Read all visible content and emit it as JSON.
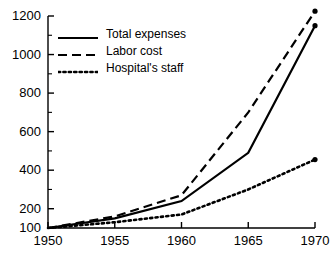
{
  "chart_data": {
    "type": "line",
    "title": "",
    "subtitle": "",
    "xlabel": "",
    "ylabel": "",
    "x": [
      1950,
      1955,
      1960,
      1965,
      1970
    ],
    "xlim": [
      1950,
      1970
    ],
    "ylim": [
      100,
      1200
    ],
    "grid": false,
    "legend_position": "top-left",
    "x_tick_labels": [
      "1950",
      "1955",
      "1960",
      "1965",
      "1970"
    ],
    "y_tick_labels": [
      "100",
      "200",
      "400",
      "600",
      "800",
      "1000",
      "1200"
    ],
    "y_tick_values": [
      100,
      200,
      400,
      600,
      800,
      1000,
      1200
    ],
    "y_minor_ticks": [
      300,
      500,
      700,
      900,
      1100
    ],
    "x_minor_ticks": [
      1951,
      1952,
      1953,
      1954,
      1956,
      1957,
      1958,
      1959,
      1961,
      1962,
      1963,
      1964,
      1966,
      1967,
      1968,
      1969
    ],
    "series": [
      {
        "name": "Total expenses",
        "style": "solid",
        "color": "#000000",
        "end_marker": true,
        "values": [
          100,
          150,
          240,
          490,
          1150
        ]
      },
      {
        "name": "Labor cost",
        "style": "dashed",
        "color": "#000000",
        "end_marker": true,
        "values": [
          100,
          160,
          270,
          700,
          1225
        ]
      },
      {
        "name": "Hospital's staff",
        "style": "dotted",
        "color": "#000000",
        "end_marker": true,
        "values": [
          100,
          130,
          170,
          300,
          455
        ]
      }
    ]
  },
  "legend": {
    "items": [
      {
        "label": "Total expenses",
        "sample": "solid-line-sample"
      },
      {
        "label": "Labor cost",
        "sample": "dashed-line-sample"
      },
      {
        "label": "Hospital's staff",
        "sample": "dotted-line-sample"
      }
    ]
  },
  "axis": {
    "y_labels": [
      "1200",
      "1000",
      "800",
      "600",
      "400",
      "200",
      "100"
    ],
    "x_labels": [
      "1950",
      "1955",
      "1960",
      "1965",
      "1970"
    ]
  }
}
